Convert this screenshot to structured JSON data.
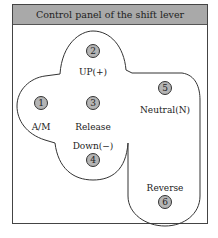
{
  "title": "Control panel of the shift lever",
  "positions": [
    {
      "number": "1",
      "label": "A/M",
      "cx": 41,
      "cy": 103,
      "lx": 41,
      "ly": 127
    },
    {
      "number": "2",
      "label": "UP(+)",
      "cx": 93,
      "cy": 51,
      "lx": 93,
      "ly": 72
    },
    {
      "number": "3",
      "label": "Release",
      "cx": 93,
      "cy": 103,
      "lx": 93,
      "ly": 127
    },
    {
      "number": "4",
      "label": "Down(−)",
      "cx": 93,
      "cy": 160,
      "lx": 93,
      "ly": 146
    },
    {
      "number": "5",
      "label": "Neutral(N)",
      "cx": 165,
      "cy": 88,
      "lx": 165,
      "ly": 110
    },
    {
      "number": "6",
      "label": "Reverse",
      "cx": 165,
      "cy": 202,
      "lx": 165,
      "ly": 188
    }
  ],
  "colors": {
    "header": "#a9a9a9",
    "circle_fill": "#b4b4b4",
    "outline": "#333333"
  }
}
